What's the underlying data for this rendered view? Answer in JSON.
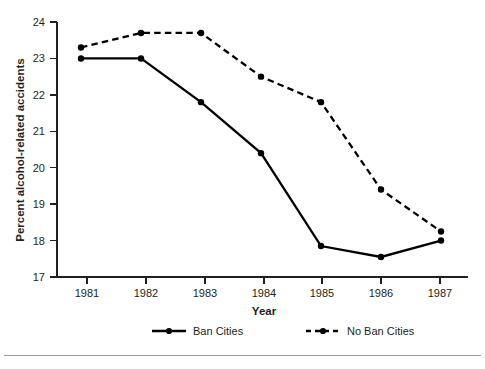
{
  "chart_data": {
    "type": "line",
    "title": "",
    "xlabel": "Year",
    "ylabel": "Percent alcohol-related accidents",
    "categories": [
      "1981",
      "1982",
      "1983",
      "1984",
      "1985",
      "1986",
      "1987"
    ],
    "x": [
      1981,
      1982,
      1983,
      1984,
      1985,
      1986,
      1987
    ],
    "xlim": [
      1980.6,
      1987.45
    ],
    "ylim": [
      17,
      24
    ],
    "yticks": [
      "17",
      "18",
      "19",
      "20",
      "21",
      "22",
      "23",
      "24"
    ],
    "ytick_values": [
      17,
      18,
      19,
      20,
      21,
      22,
      23,
      24
    ],
    "grid": false,
    "legend_position": "bottom",
    "series": [
      {
        "name": "Ban Cities",
        "style": "solid",
        "marker": "filled-circle",
        "color": "#000000",
        "values": [
          23.0,
          23.0,
          21.8,
          20.4,
          17.85,
          17.55,
          18.0
        ]
      },
      {
        "name": "No Ban Cities",
        "style": "dashed",
        "marker": "filled-circle",
        "color": "#000000",
        "values": [
          23.3,
          23.7,
          23.7,
          22.5,
          21.8,
          19.4,
          18.25
        ]
      }
    ]
  },
  "legend": {
    "entries": [
      {
        "label": "Ban Cities",
        "style": "solid"
      },
      {
        "label": "No Ban Cities",
        "style": "dashed"
      }
    ]
  },
  "axes": {
    "x_title": "Year",
    "y_title": "Percent alcohol-related accidents",
    "x_tick_labels": [
      "1981",
      "1982",
      "1983",
      "1984",
      "1985",
      "1986",
      "1987"
    ],
    "y_tick_labels": [
      "24",
      "23",
      "22",
      "21",
      "20",
      "19",
      "18",
      "17"
    ]
  }
}
